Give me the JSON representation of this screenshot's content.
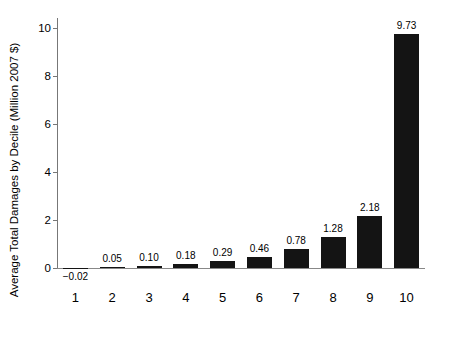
{
  "chart_data": {
    "type": "bar",
    "title": "",
    "subtitle": "",
    "xlabel": "",
    "ylabel": "Average Total Damages by Decile (Million 2007 $)",
    "categories": [
      "1",
      "2",
      "3",
      "4",
      "5",
      "6",
      "7",
      "8",
      "9",
      "10"
    ],
    "values": [
      -0.02,
      0.05,
      0.1,
      0.18,
      0.29,
      0.46,
      0.78,
      1.28,
      2.18,
      9.73
    ],
    "value_labels": [
      "−0.02",
      "0.05",
      "0.10",
      "0.18",
      "0.29",
      "0.46",
      "0.78",
      "1.28",
      "2.18",
      "9.73"
    ],
    "ylim": [
      -0.4,
      10.4
    ],
    "yticks": [
      0,
      2,
      4,
      6,
      8,
      10
    ],
    "ytick_labels": [
      "0",
      "2",
      "4",
      "6",
      "8",
      "10"
    ],
    "grid": false,
    "legend": null,
    "bar_color": "#141414",
    "axis_color": "#777777",
    "background": "#ffffff",
    "series": [
      {
        "name": "Average Total Damages by Decile (Million 2007 $)",
        "values": [
          -0.02,
          0.05,
          0.1,
          0.18,
          0.29,
          0.46,
          0.78,
          1.28,
          2.18,
          9.73
        ]
      }
    ]
  }
}
